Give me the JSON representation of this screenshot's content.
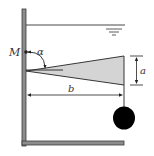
{
  "diagram": {
    "labels": {
      "pivot": "M",
      "angle": "α",
      "height": "a",
      "length": "b"
    },
    "colors": {
      "wall": "#8c8c8c",
      "wall_edge": "#3a3a3a",
      "plate_fill": "#d4d4d4",
      "line": "#222222",
      "weight": "#000000"
    },
    "elements": {
      "wall": "vertical-wall",
      "floor": "bottom-floor",
      "water_surface": "free-surface-line",
      "surface_symbol": "water-level-symbol",
      "plate": "triangular-gate",
      "weight": "hanging-ball"
    }
  }
}
